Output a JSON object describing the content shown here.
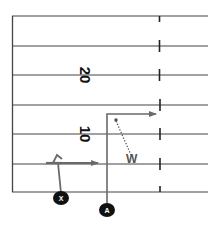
{
  "diagram": {
    "type": "football-play",
    "yard_numbers": [
      {
        "label": "20",
        "y": 75
      },
      {
        "label": "10",
        "y": 134
      }
    ],
    "yard_lines_y": [
      16,
      46,
      75,
      105,
      134,
      164,
      192
    ],
    "players": [
      {
        "id": "X",
        "label": "X",
        "x": 61,
        "y": 198
      },
      {
        "id": "A",
        "label": "A",
        "x": 107,
        "y": 210
      }
    ],
    "defender": {
      "label": "W"
    },
    "colors": {
      "line": "#444444",
      "route": "#6a6a6a",
      "player_fill": "#111111",
      "player_text": "#ffffff"
    }
  }
}
